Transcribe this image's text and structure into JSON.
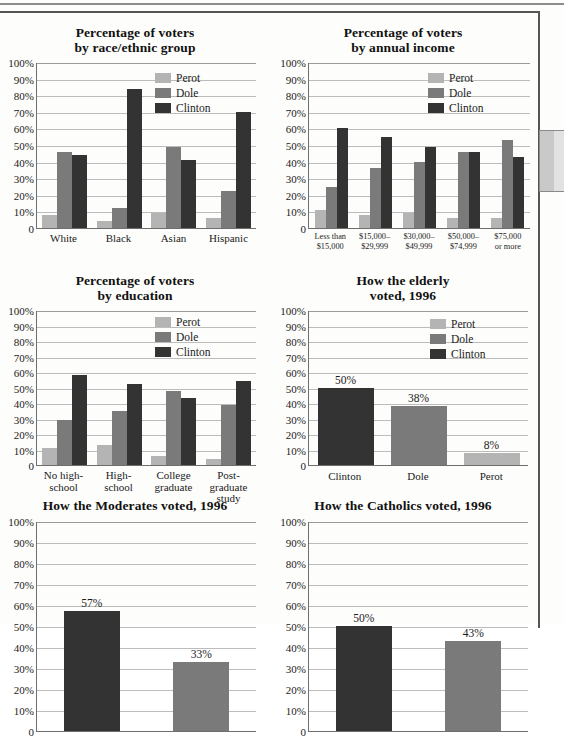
{
  "page": {
    "background_color": "#fdfdfb",
    "border_color": "#555555",
    "side_tab_name": "page-side-tab"
  },
  "series_colors": {
    "Perot": "#b4b4b4",
    "Dole": "#7a7a7a",
    "Clinton": "#333333"
  },
  "y_ticks": [
    "100%",
    "90%",
    "80%",
    "70%",
    "60%",
    "50%",
    "40%",
    "30%",
    "20%",
    "10%",
    "0"
  ],
  "legend_entries": [
    "Perot",
    "Dole",
    "Clinton"
  ],
  "chart_data": [
    {
      "id": "voters-by-race",
      "type": "bar",
      "title": "Percentage of voters\nby race/ethnic group",
      "title_line1": "Percentage of voters",
      "title_line2": "by race/ethnic group",
      "xlabel": "",
      "ylabel": "",
      "ylim": [
        0,
        100
      ],
      "grid": true,
      "legend": [
        "Perot",
        "Dole",
        "Clinton"
      ],
      "legend_position": "top-right-inside",
      "categories": [
        "White",
        "Black",
        "Asian",
        "Hispanic"
      ],
      "series": [
        {
          "name": "Perot",
          "values": [
            8,
            4,
            9,
            6
          ]
        },
        {
          "name": "Dole",
          "values": [
            46,
            12,
            49,
            22
          ]
        },
        {
          "name": "Clinton",
          "values": [
            44,
            84,
            41,
            70
          ]
        }
      ]
    },
    {
      "id": "voters-by-income",
      "type": "bar",
      "title": "Percentage of voters\nby annual income",
      "title_line1": "Percentage of voters",
      "title_line2": "by annual income",
      "xlabel": "",
      "ylabel": "",
      "ylim": [
        0,
        100
      ],
      "grid": true,
      "legend": [
        "Perot",
        "Dole",
        "Clinton"
      ],
      "legend_position": "top-right-inside",
      "categories": [
        "Less than\n$15,000",
        "$15,000–\n$29,999",
        "$30,000–\n$49,999",
        "$50,000–\n$74,999",
        "$75,000\nor more"
      ],
      "category_lines": [
        [
          "Less than",
          "$15,000"
        ],
        [
          "$15,000–",
          "$29,999"
        ],
        [
          "$30,000–",
          "$49,999"
        ],
        [
          "$50,000–",
          "$74,999"
        ],
        [
          "$75,000",
          "or more"
        ]
      ],
      "series": [
        {
          "name": "Perot",
          "values": [
            11,
            8,
            9,
            6,
            6
          ]
        },
        {
          "name": "Dole",
          "values": [
            25,
            36,
            40,
            46,
            53
          ]
        },
        {
          "name": "Clinton",
          "values": [
            60,
            55,
            49,
            46,
            43
          ]
        }
      ]
    },
    {
      "id": "voters-by-education",
      "type": "bar",
      "title": "Percentage of voters\nby education",
      "title_line1": "Percentage of voters",
      "title_line2": "by education",
      "xlabel": "",
      "ylabel": "",
      "ylim": [
        0,
        100
      ],
      "grid": true,
      "legend": [
        "Perot",
        "Dole",
        "Clinton"
      ],
      "legend_position": "top-right-inside",
      "categories": [
        "No high-\nschool",
        "High-\nschool",
        "College\ngraduate",
        "Post-\ngraduate\nstudy"
      ],
      "category_lines": [
        [
          "No high-",
          "school"
        ],
        [
          "High-",
          "school"
        ],
        [
          "College",
          "graduate"
        ],
        [
          "Post-",
          "graduate",
          "study"
        ]
      ],
      "series": [
        {
          "name": "Perot",
          "values": [
            11,
            13,
            6,
            4
          ]
        },
        {
          "name": "Dole",
          "values": [
            29,
            35,
            48,
            39
          ]
        },
        {
          "name": "Clinton",
          "values": [
            58,
            52,
            43,
            54
          ]
        }
      ]
    },
    {
      "id": "elderly-voted-1996",
      "type": "bar",
      "title": "How the elderly\nvoted, 1996",
      "title_line1": "How the elderly",
      "title_line2": "voted, 1996",
      "xlabel": "",
      "ylabel": "",
      "ylim": [
        0,
        100
      ],
      "grid": true,
      "legend": [
        "Perot",
        "Dole",
        "Clinton"
      ],
      "legend_position": "top-right-inside",
      "categories": [
        "Clinton",
        "Dole",
        "Perot"
      ],
      "values": [
        50,
        38,
        8
      ],
      "data_labels": [
        "50%",
        "38%",
        "8%"
      ],
      "bar_colors": [
        "Clinton",
        "Dole",
        "Perot"
      ]
    },
    {
      "id": "moderates-voted-1996",
      "type": "bar",
      "title": "How the Moderates voted, 1996",
      "title_line1": "How the Moderates voted, 1996",
      "title_line2": "",
      "xlabel": "",
      "ylabel": "",
      "ylim": [
        0,
        100
      ],
      "grid": true,
      "legend": [],
      "categories": [
        "Clinton",
        "Dole"
      ],
      "values": [
        57,
        33
      ],
      "data_labels": [
        "57%",
        "33%"
      ],
      "bar_colors": [
        "Clinton",
        "Dole"
      ],
      "note": "chart cropped at bottom edge of screenshot"
    },
    {
      "id": "catholics-voted-1996",
      "type": "bar",
      "title": "How the Catholics voted, 1996",
      "title_line1": "How the Catholics voted, 1996",
      "title_line2": "",
      "xlabel": "",
      "ylabel": "",
      "ylim": [
        0,
        100
      ],
      "grid": true,
      "legend": [],
      "categories": [
        "Clinton",
        "Dole"
      ],
      "values": [
        50,
        43
      ],
      "data_labels": [
        "50%",
        "43%"
      ],
      "bar_colors": [
        "Clinton",
        "Dole"
      ],
      "note": "chart cropped at bottom edge of screenshot"
    }
  ]
}
